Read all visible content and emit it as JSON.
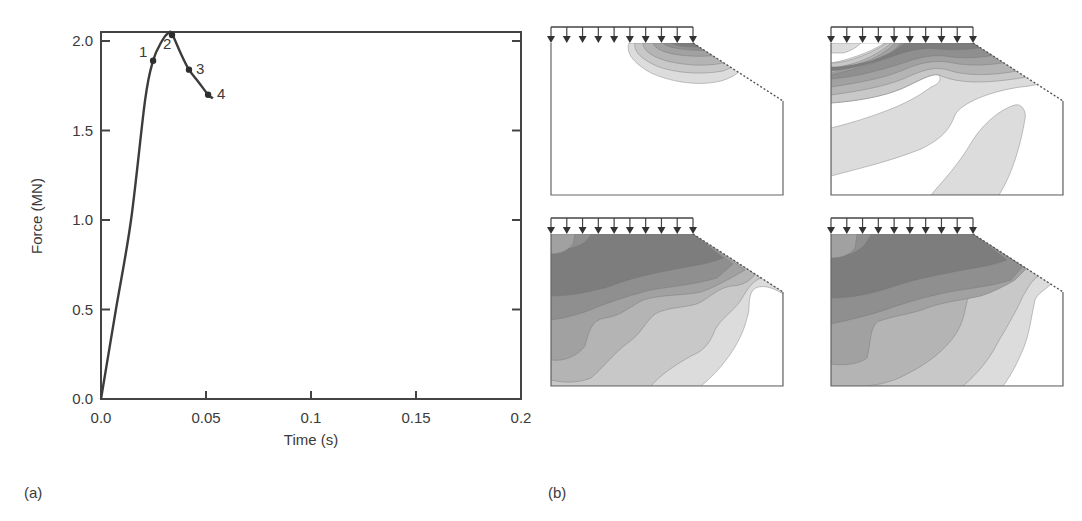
{
  "figure": {
    "panel_a_label": "(a)",
    "panel_b_label": "(b)"
  },
  "chart_data": [
    {
      "type": "line",
      "panel": "(a)",
      "title": "",
      "xlabel": "Time (s)",
      "ylabel": "Force (MN)",
      "xlim": [
        0.0,
        0.2
      ],
      "ylim": [
        0.0,
        2.05
      ],
      "xticks": [
        0.0,
        0.05,
        0.1,
        0.15,
        0.2
      ],
      "xtick_labels": [
        "0.0",
        "0.05",
        "0.1",
        "0.15",
        "0.2"
      ],
      "yticks": [
        0.0,
        0.5,
        1.0,
        1.5,
        2.0
      ],
      "ytick_labels": [
        "0.0",
        "0.5",
        "1.0",
        "1.5",
        "2.0"
      ],
      "grid": false,
      "legend": null,
      "color": "#3c3c3c",
      "series": [
        {
          "name": "Force-time response",
          "x": [
            0.0,
            0.0071,
            0.0143,
            0.021,
            0.0248,
            0.029,
            0.032,
            0.0338,
            0.038,
            0.0419,
            0.0465,
            0.051,
            0.0533
          ],
          "y": [
            0.0,
            0.5,
            1.0,
            1.67,
            1.89,
            2.0,
            2.05,
            2.04,
            1.93,
            1.84,
            1.77,
            1.7,
            1.68
          ]
        }
      ],
      "annotations": [
        {
          "label": "1",
          "x": 0.0248,
          "y": 1.89
        },
        {
          "label": "2",
          "x": 0.0338,
          "y": 2.04
        },
        {
          "label": "3",
          "x": 0.0419,
          "y": 1.84
        },
        {
          "label": "4",
          "x": 0.051,
          "y": 1.7
        }
      ]
    },
    {
      "type": "heatmap",
      "panel": "(b)",
      "title": "",
      "description": "Four contour plots of damage/stress distribution in a slope body under uniform surface load (10 arrows), corresponding to points 1-4 on the force-time curve",
      "layout": "2x2 grid",
      "subplots": [
        {
          "state": 1,
          "position": "top-left",
          "load_arrows": 10,
          "extent": "small zone beneath right end of load near slope crest"
        },
        {
          "state": 2,
          "position": "top-right",
          "load_arrows": 10,
          "extent": "band under entire load spreading toward slope"
        },
        {
          "state": 3,
          "position": "bottom-left",
          "load_arrows": 10,
          "extent": "most of body, lighter toward lower right"
        },
        {
          "state": 4,
          "position": "bottom-right",
          "load_arrows": 10,
          "extent": "nearly whole body shaded"
        }
      ],
      "shades": [
        "#6e6e6e",
        "#7d7d7d",
        "#8f8f8f",
        "#a1a1a1",
        "#b4b4b4",
        "#c8c8c8",
        "#dcdcdc",
        "#ffffff"
      ]
    }
  ]
}
